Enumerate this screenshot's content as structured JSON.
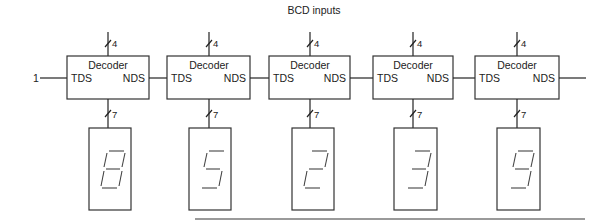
{
  "title": "BCD inputs",
  "input_label": "1",
  "bus_widths": {
    "input": "4",
    "output": "7"
  },
  "decoders": [
    {
      "title": "Decoder",
      "left_port": "TDS",
      "right_port": "NDS",
      "digit": "8"
    },
    {
      "title": "Decoder",
      "left_port": "TDS",
      "right_port": "NDS",
      "digit": "5"
    },
    {
      "title": "Decoder",
      "left_port": "TDS",
      "right_port": "NDS",
      "digit": "2"
    },
    {
      "title": "Decoder",
      "left_port": "TDS",
      "right_port": "NDS",
      "digit": "3"
    },
    {
      "title": "Decoder",
      "left_port": "TDS",
      "right_port": "NDS",
      "digit": "9"
    }
  ],
  "colors": {
    "line": "#222222",
    "footer_rule": "#9a9a9a"
  }
}
